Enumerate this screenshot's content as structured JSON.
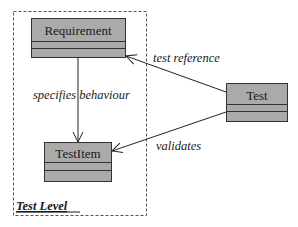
{
  "diagram": {
    "type": "UML class diagram",
    "frame": {
      "label": "Test Level"
    },
    "classes": [
      {
        "name": "Requirement"
      },
      {
        "name": "TestItem"
      },
      {
        "name": "Test"
      }
    ],
    "associations": [
      {
        "label": "specifies behaviour",
        "from": "Requirement",
        "to": "TestItem"
      },
      {
        "label": "test reference",
        "from": "Test",
        "to": "Requirement"
      },
      {
        "label": "validates",
        "from": "Test",
        "to": "TestItem"
      }
    ],
    "colors": {
      "class_fill": "#aaaaaa",
      "stroke": "#333333",
      "frame_stroke": "#555555"
    }
  }
}
